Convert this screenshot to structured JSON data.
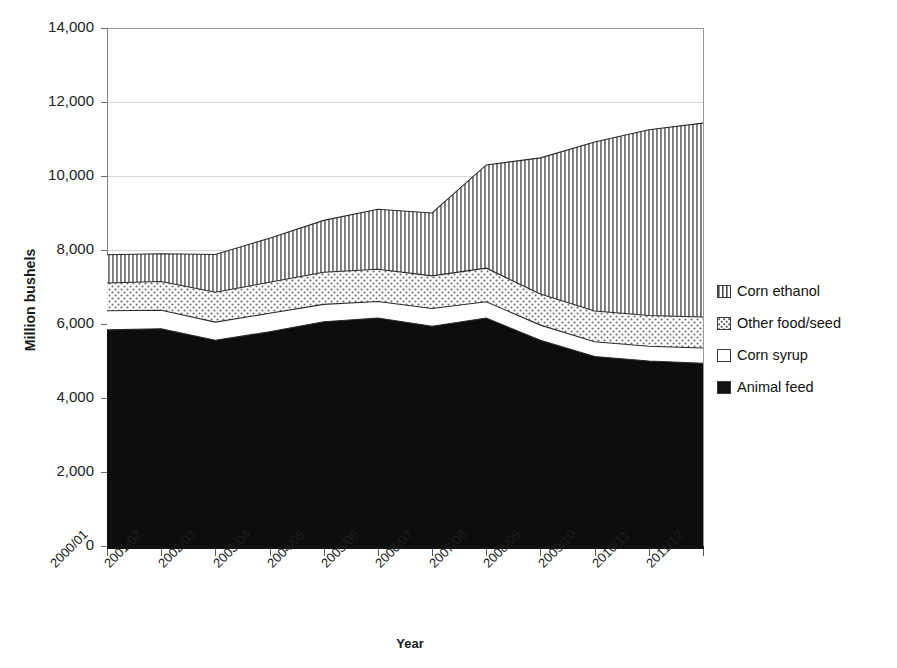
{
  "chart_data": {
    "type": "area",
    "stacked": true,
    "title": "",
    "xlabel": "Year",
    "ylabel": "Million bushels",
    "categories": [
      "2000/01",
      "2001/02",
      "2002/03",
      "2003/04",
      "2004/05",
      "2005/06",
      "2006/07",
      "2007/08",
      "2008/09",
      "2009/10",
      "2010/11",
      "2011/12"
    ],
    "ytick_labels": [
      "14,000",
      "12,000",
      "10,000",
      "8,000",
      "6,000",
      "4,000",
      "2,000",
      "0"
    ],
    "ytick_values": [
      14000,
      12000,
      10000,
      8000,
      6000,
      4000,
      2000,
      0
    ],
    "ylim": [
      0,
      14000
    ],
    "grid": true,
    "legend_position": "right",
    "series": [
      {
        "name": "Animal feed",
        "fill": "solid-black",
        "values": [
          5840,
          5870,
          5560,
          5790,
          6060,
          6160,
          5940,
          6160,
          5560,
          5120,
          5000,
          4940
        ]
      },
      {
        "name": "Corn syrup",
        "fill": "white-empty",
        "values": [
          520,
          500,
          490,
          500,
          470,
          450,
          480,
          440,
          410,
          400,
          400,
          410
        ]
      },
      {
        "name": "Other food/seed",
        "fill": "dotted",
        "values": [
          750,
          780,
          810,
          840,
          870,
          870,
          880,
          910,
          840,
          830,
          830,
          840
        ]
      },
      {
        "name": "Corn ethanol",
        "fill": "vertical-stripes",
        "values": [
          760,
          750,
          1020,
          1190,
          1400,
          1620,
          1700,
          2790,
          3680,
          4570,
          5020,
          5240
        ]
      }
    ],
    "stack_totals": [
      7870,
      7900,
      7880,
      8320,
      8800,
      9100,
      9000,
      10300,
      10490,
      10920,
      11250,
      11430
    ],
    "cumulative_boundaries": {
      "feed_top": [
        5840,
        5870,
        5560,
        5790,
        6060,
        6160,
        5940,
        6160,
        5560,
        5120,
        5000,
        4940
      ],
      "syrup_top": [
        6360,
        6370,
        6050,
        6290,
        6530,
        6610,
        6420,
        6600,
        5970,
        5520,
        5400,
        5350
      ],
      "foodseed_top": [
        7110,
        7150,
        6860,
        7130,
        7400,
        7480,
        7300,
        7510,
        6810,
        6350,
        6230,
        6190
      ],
      "ethanol_top": [
        7870,
        7900,
        7880,
        8320,
        8800,
        9100,
        9000,
        10300,
        10490,
        10920,
        11250,
        11430
      ]
    }
  },
  "legend": {
    "items": [
      {
        "label": "Corn ethanol",
        "swatch": "vertical-stripes-swatch"
      },
      {
        "label": "Other food/seed",
        "swatch": "dotted-swatch"
      },
      {
        "label": "Corn syrup",
        "swatch": "empty-swatch"
      },
      {
        "label": "Animal feed",
        "swatch": "solid-black-swatch"
      }
    ]
  },
  "axes": {
    "y_title": "Million bushels",
    "x_title": "Year"
  }
}
